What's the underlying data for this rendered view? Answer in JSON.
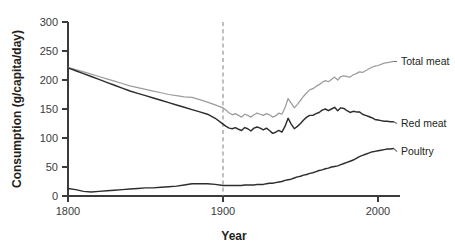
{
  "chart_data": {
    "type": "line",
    "title": "",
    "xlabel": "Year",
    "ylabel": "Consumption (g/capita/day)",
    "xlim": [
      1800,
      2010
    ],
    "ylim": [
      0,
      300
    ],
    "xticks": [
      1800,
      1900,
      2000
    ],
    "xtick_labels": [
      "1800",
      "1900",
      "2000"
    ],
    "yticks": [
      0,
      50,
      100,
      150,
      200,
      250,
      300
    ],
    "ytick_labels": [
      "0",
      "50",
      "100",
      "150",
      "200",
      "250",
      "300"
    ],
    "grid": false,
    "legend_position": "right-inline-labels",
    "annotations": [
      {
        "name": "reference-line-1900",
        "type": "vline",
        "x": 1900,
        "style": "dashed"
      }
    ],
    "colors": {
      "total_meat": "#9c9c9c",
      "red_meat": "#2d2d2d",
      "poultry": "#2d2d2d",
      "axis": "#3b3b3b",
      "reference_line": "#8a8a8a",
      "background": "#ffffff"
    },
    "x": [
      1800,
      1805,
      1810,
      1815,
      1820,
      1825,
      1830,
      1835,
      1840,
      1845,
      1850,
      1855,
      1860,
      1865,
      1870,
      1875,
      1880,
      1885,
      1890,
      1895,
      1900,
      1902,
      1904,
      1906,
      1908,
      1910,
      1912,
      1914,
      1916,
      1918,
      1920,
      1922,
      1924,
      1926,
      1928,
      1930,
      1932,
      1934,
      1936,
      1938,
      1940,
      1942,
      1944,
      1946,
      1948,
      1950,
      1952,
      1954,
      1956,
      1958,
      1960,
      1962,
      1964,
      1966,
      1968,
      1970,
      1972,
      1974,
      1976,
      1978,
      1980,
      1982,
      1984,
      1986,
      1988,
      1990,
      1992,
      1994,
      1996,
      1998,
      2000,
      2002,
      2004,
      2006,
      2008,
      2010
    ],
    "series": [
      {
        "name": "Total meat",
        "color": "#9c9c9c",
        "label_position": "right",
        "values": [
          222,
          218,
          214,
          210,
          206,
          202,
          198,
          194,
          190,
          187,
          184,
          181,
          178,
          175,
          173,
          171,
          170,
          166,
          162,
          157,
          152,
          148,
          143,
          140,
          142,
          139,
          136,
          141,
          139,
          136,
          140,
          143,
          141,
          139,
          142,
          140,
          136,
          138,
          143,
          141,
          152,
          168,
          160,
          152,
          158,
          165,
          172,
          178,
          183,
          185,
          189,
          192,
          196,
          199,
          197,
          201,
          205,
          200,
          206,
          207,
          206,
          205,
          209,
          211,
          214,
          213,
          216,
          219,
          222,
          224,
          225,
          227,
          229,
          230,
          231,
          232
        ]
      },
      {
        "name": "Red meat",
        "color": "#2d2d2d",
        "label_position": "right",
        "values": [
          221,
          216,
          211,
          206,
          201,
          196,
          191,
          186,
          181,
          177,
          173,
          169,
          165,
          161,
          157,
          153,
          149,
          145,
          141,
          134,
          124,
          120,
          117,
          116,
          118,
          115,
          113,
          118,
          116,
          112,
          117,
          119,
          117,
          114,
          117,
          113,
          108,
          110,
          113,
          110,
          120,
          134,
          124,
          116,
          120,
          125,
          131,
          136,
          139,
          139,
          142,
          144,
          148,
          150,
          147,
          150,
          153,
          147,
          152,
          151,
          147,
          144,
          146,
          145,
          145,
          141,
          139,
          137,
          135,
          132,
          131,
          130,
          129,
          129,
          128,
          128
        ]
      },
      {
        "name": "Poultry",
        "color": "#2d2d2d",
        "label_position": "right",
        "values": [
          13,
          11,
          8,
          7,
          8,
          9,
          10,
          11,
          12,
          13,
          14,
          14,
          15,
          16,
          17,
          19,
          21,
          21,
          21,
          20,
          18,
          18,
          18,
          18,
          18,
          18,
          18,
          19,
          19,
          19,
          19,
          20,
          20,
          20,
          21,
          22,
          22,
          23,
          24,
          25,
          27,
          28,
          29,
          31,
          33,
          34,
          36,
          37,
          39,
          40,
          42,
          44,
          45,
          47,
          48,
          50,
          51,
          52,
          54,
          56,
          58,
          60,
          62,
          65,
          68,
          70,
          72,
          74,
          76,
          77,
          78,
          79,
          80,
          81,
          81,
          82
        ]
      }
    ]
  },
  "labels": {
    "total_meat": "Total meat",
    "red_meat": "Red meat",
    "poultry": "Poultry",
    "x_axis_title": "Year",
    "y_axis_title": "Consumption (g/capita/day)"
  }
}
